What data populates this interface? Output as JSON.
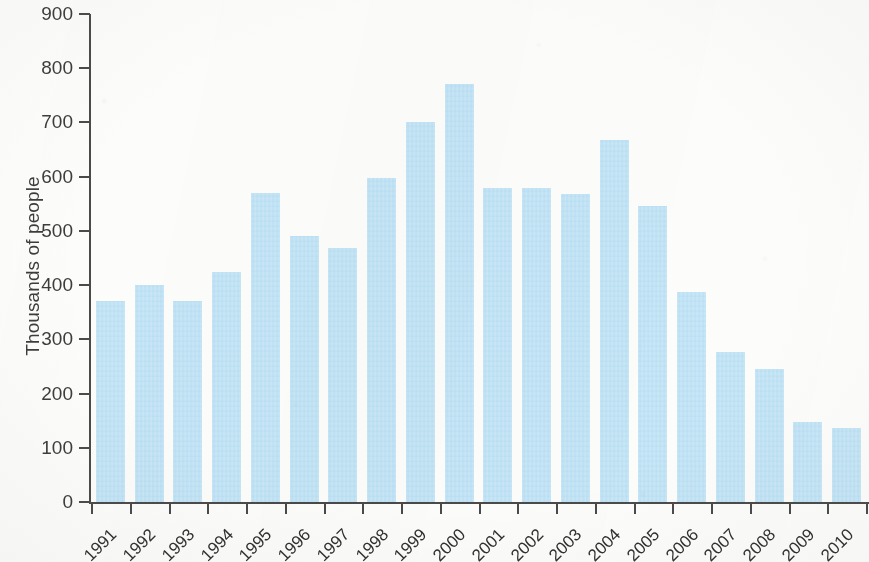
{
  "chart_data": {
    "type": "bar",
    "title": "",
    "subtitle": "",
    "xlabel": "",
    "ylabel": "Thousands of people",
    "categories": [
      "1991",
      "1992",
      "1993",
      "1994",
      "1995",
      "1996",
      "1997",
      "1998",
      "1999",
      "2000",
      "2001",
      "2002",
      "2003",
      "2004",
      "2005",
      "2006",
      "2007",
      "2008",
      "2009",
      "2010"
    ],
    "values": [
      370,
      400,
      370,
      425,
      570,
      490,
      468,
      598,
      700,
      770,
      580,
      580,
      568,
      668,
      546,
      388,
      277,
      246,
      148,
      137
    ],
    "ylim": [
      0,
      900
    ],
    "ytick_labels": [
      "0",
      "100",
      "200",
      "300",
      "400",
      "500",
      "600",
      "700",
      "800",
      "900"
    ],
    "ytick_values": [
      0,
      100,
      200,
      300,
      400,
      500,
      600,
      700,
      800,
      900
    ],
    "grid": false,
    "legend": null,
    "bar_color": "#bfe3f6",
    "axis_color": "#4a4a4a",
    "text_color": "#3c3c3c",
    "background_color": "#fdfdfb"
  }
}
